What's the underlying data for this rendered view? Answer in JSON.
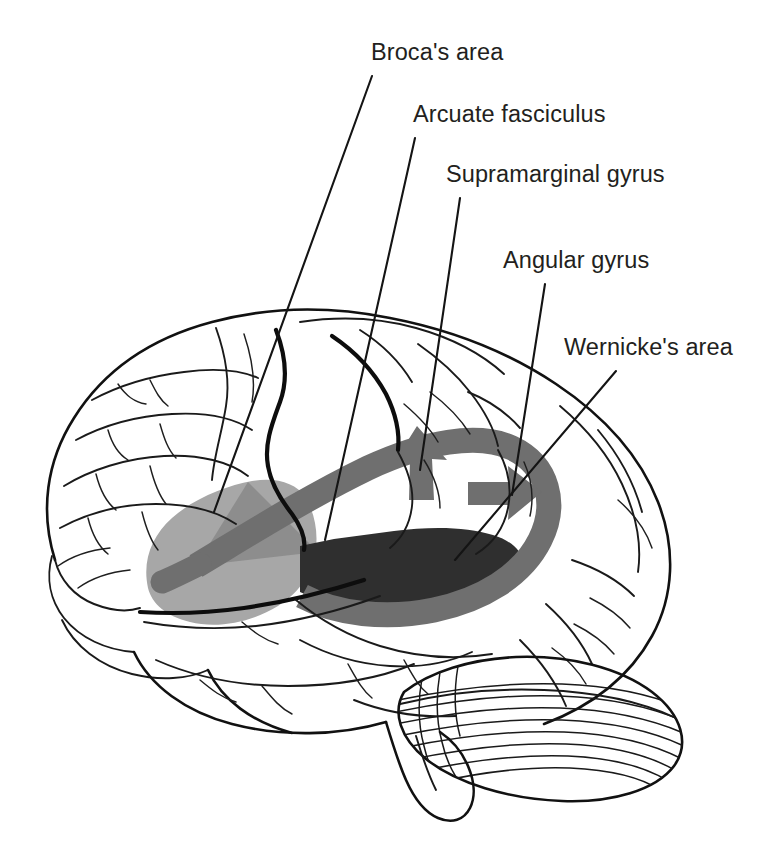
{
  "figure": {
    "view": "lateral view of left hemisphere, anterior to the left",
    "background_color": "#ffffff",
    "width": 775,
    "height": 852
  },
  "labels": [
    {
      "id": "brocas-area",
      "text": "Broca's area",
      "text_x": 371,
      "text_y": 60,
      "leader": {
        "x1": 372,
        "y1": 76,
        "x2": 214,
        "y2": 512
      }
    },
    {
      "id": "arcuate-fasciculus",
      "text": "Arcuate fasciculus",
      "text_x": 413,
      "text_y": 122,
      "leader": {
        "x1": 415,
        "y1": 138,
        "x2": 325,
        "y2": 540
      }
    },
    {
      "id": "supramarginal-gyrus",
      "text": "Supramarginal gyrus",
      "text_x": 446,
      "text_y": 182,
      "leader": {
        "x1": 460,
        "y1": 198,
        "x2": 420,
        "y2": 470
      }
    },
    {
      "id": "angular-gyrus",
      "text": "Angular gyrus",
      "text_x": 503,
      "text_y": 268,
      "leader": {
        "x1": 545,
        "y1": 284,
        "x2": 512,
        "y2": 495
      }
    },
    {
      "id": "wernickes-area",
      "text": "Wernicke's area",
      "text_x": 564,
      "text_y": 355,
      "leader": {
        "x1": 616,
        "y1": 371,
        "x2": 455,
        "y2": 560
      }
    }
  ],
  "regions": [
    {
      "id": "brocas-area-shading",
      "name": "Broca's area",
      "color": "#a7a7a7",
      "accent_color": "#8e8e8e",
      "description": "light gray shaded region in inferior frontal gyrus"
    },
    {
      "id": "wernickes-area-shading",
      "name": "Wernicke's area",
      "color": "#2f2f2f",
      "description": "dark charcoal shaded region in posterior superior temporal gyrus"
    },
    {
      "id": "arcuate-fasciculus-arrow",
      "name": "Arcuate fasciculus",
      "color": "#6f6f6f",
      "description": "thick medium-gray curved band with two arrowheads connecting Wernicke's area to Broca's area"
    }
  ],
  "anatomy": [
    {
      "id": "frontal-lobe",
      "name": "Frontal lobe"
    },
    {
      "id": "parietal-lobe",
      "name": "Parietal lobe"
    },
    {
      "id": "temporal-lobe",
      "name": "Temporal lobe"
    },
    {
      "id": "occipital-lobe",
      "name": "Occipital lobe"
    },
    {
      "id": "cerebellum",
      "name": "Cerebellum"
    },
    {
      "id": "brainstem",
      "name": "Brainstem"
    },
    {
      "id": "central-sulcus",
      "name": "Central sulcus"
    },
    {
      "id": "lateral-sulcus",
      "name": "Lateral (Sylvian) fissure"
    }
  ],
  "colors": {
    "ink": "#111111",
    "text": "#231f20",
    "brocas": "#a7a7a7",
    "brocas_accent": "#8e8e8e",
    "wernickes": "#2f2f2f",
    "arcuate": "#6f6f6f",
    "background": "#ffffff"
  }
}
